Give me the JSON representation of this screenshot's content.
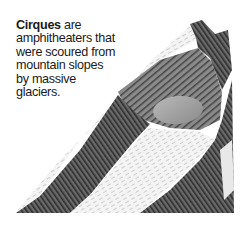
{
  "caption": {
    "term": "Cirques",
    "text": " are amphitheaters that were scoured from mountain slopes by massive glaciers."
  },
  "illustration": {
    "subject": "mountain cirque with glacial lake",
    "colors": {
      "rock_dark": "#3a3a3a",
      "rock_mid": "#7a7a7a",
      "snow": "#f2f2f2",
      "lake": "#9a9a9a"
    }
  }
}
